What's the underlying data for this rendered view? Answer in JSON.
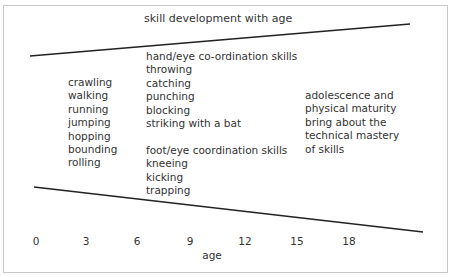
{
  "title": "skill development with age",
  "fundamental_skills": [
    "crawling",
    "walking",
    "running",
    "jumping",
    "hopping",
    "bounding",
    "rolling"
  ],
  "coordination_skills": [
    "hand/eye co-ordination skills",
    "throwing",
    "catching",
    "punching",
    "blocking",
    "striking with a bat",
    "",
    "foot/eye coordination skills",
    "kneeing",
    "kicking",
    "trapping"
  ],
  "maturity_note": [
    "adolescence and",
    "physical maturity",
    "bring about the",
    "technical mastery",
    "of skills"
  ],
  "axis": {
    "label": "age",
    "ticks": [
      "0",
      "3",
      "6",
      "9",
      "12",
      "15",
      "18"
    ]
  },
  "colors": {
    "line": "#222222",
    "border": "#c8c8c8",
    "text": "#333333"
  }
}
